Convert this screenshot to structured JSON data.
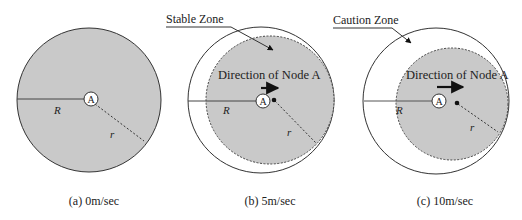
{
  "colors": {
    "zone_fill": "#c9c9c9",
    "stroke": "#333333",
    "background": "#ffffff"
  },
  "panels": [
    {
      "id": "a",
      "caption": "(a) 0m/sec",
      "node_label": "A",
      "R_label": "R",
      "r_label": "r"
    },
    {
      "id": "b",
      "caption": "(b) 5m/sec",
      "node_label": "A",
      "R_label": "R",
      "r_label": "r",
      "direction_label": "Direction of Node A",
      "zone_callout": "Stable Zone"
    },
    {
      "id": "c",
      "caption": "(c) 10m/sec",
      "node_label": "A",
      "R_label": "R",
      "r_label": "r",
      "direction_label": "Direction of Node A",
      "zone_callout": "Caution Zone"
    }
  ]
}
